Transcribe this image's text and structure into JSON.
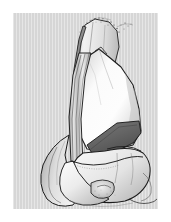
{
  "figure": {
    "kind": "anatomical-illustration",
    "orientation": "anterior view",
    "style": "grayscale pen-and-ink medical drawing",
    "caption": "",
    "label": ""
  },
  "page": {
    "background_color": "#ffffff",
    "margin_px": 13
  },
  "panel": {
    "background_color": "#d6d6d6",
    "texture": "vertical-scanlines",
    "x": 13,
    "y": 13,
    "width": 145,
    "height": 196
  },
  "palette": {
    "page_white": "#ffffff",
    "panel_gray": "#d6d6d6",
    "bone_highlight": "#fcfcfc",
    "bone_light": "#f0f0f0",
    "bone_mid": "#d8d8d8",
    "bone_shadow": "#b4b4b4",
    "cartilage_gray": "#c2c2c2",
    "wedge_dark": "#6d6d6d",
    "wedge_darker": "#5a5a5a",
    "outline": "#1c1c1c",
    "stipple": "#3a3a3a"
  },
  "structures": [
    {
      "id": "quadriceps-tendon",
      "name": "Quadriceps tendon (cut, stippled edge)",
      "tone": "bone_light"
    },
    {
      "id": "tendon-graft-strip",
      "name": "Longitudinal tendon graft strip",
      "tone": "bone_mid"
    },
    {
      "id": "patella-body",
      "name": "Patella (anterior surface)",
      "tone": "bone_highlight"
    },
    {
      "id": "resected-wedge",
      "name": "Resected dark wedge / trochlear defect",
      "tone": "wedge_dark"
    },
    {
      "id": "lateral-femoral-condyle",
      "name": "Lateral femoral condyle",
      "tone": "bone_light"
    },
    {
      "id": "medial-femoral-condyle",
      "name": "Medial femoral condyle",
      "tone": "bone_light"
    },
    {
      "id": "intercondylar-notch",
      "name": "Intercondylar notch region",
      "tone": "bone_shadow"
    },
    {
      "id": "suture-thread",
      "name": "Trailing suture thread",
      "tone": "outline"
    }
  ]
}
